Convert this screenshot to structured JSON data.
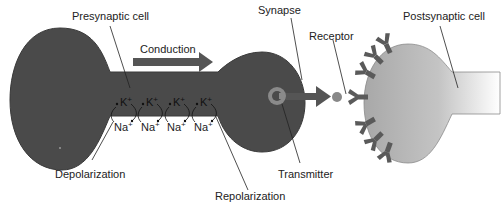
{
  "diagram": {
    "labels": {
      "presynaptic": "Presynaptic cell",
      "conduction": "Conduction",
      "synapse": "Synapse",
      "receptor": "Receptor",
      "postsynaptic": "Postsynaptic cell",
      "depolarization": "Depolarization",
      "repolarization": "Repolarization",
      "transmitter": "Transmitter"
    },
    "ions": {
      "potassium": [
        "K",
        "K",
        "K",
        "K"
      ],
      "potassium_charge": "+",
      "sodium": [
        "Na",
        "Na",
        "Na",
        "Na"
      ],
      "sodium_charge": "+"
    },
    "colors": {
      "presynaptic_fill": "#4a4a4a",
      "postsynaptic_fill": "#b5b5b5",
      "receptor_fill": "#5a5a5a",
      "arrow_fill": "#555555",
      "transmitter_ring": "#8a8a8a",
      "transmitter_dot": "#888888",
      "leader_line": "#222222"
    }
  }
}
